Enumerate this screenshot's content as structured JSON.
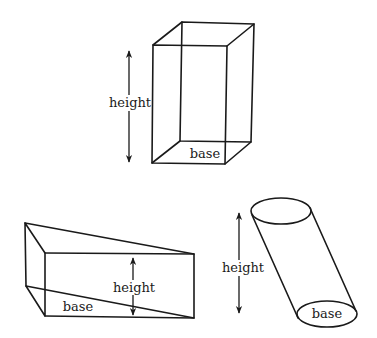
{
  "figure": {
    "shapes": [
      {
        "name": "rectangular-prism",
        "labels": {
          "height": "height",
          "base": "base"
        }
      },
      {
        "name": "triangular-prism",
        "labels": {
          "height": "height",
          "base": "base"
        }
      },
      {
        "name": "oblique-cylinder",
        "labels": {
          "height": "height",
          "base": "base"
        }
      }
    ]
  },
  "colors": {
    "stroke": "#1a1a1a",
    "background": "#ffffff"
  }
}
